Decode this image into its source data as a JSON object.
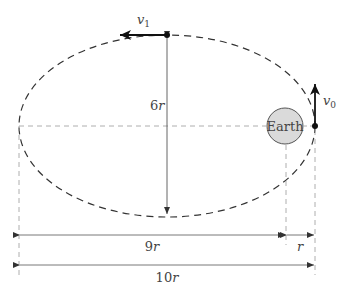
{
  "diagram": {
    "type": "elliptical-orbit",
    "labels": {
      "v1": "v",
      "v1_sub": "1",
      "v0": "v",
      "v0_sub": "0",
      "earth": "Earth",
      "semi_minor_num": "6",
      "semi_minor_var": "r",
      "dist_9_num": "9",
      "dist_9_var": "r",
      "dist_r": "r",
      "dist_10_num": "10",
      "dist_10_var": "r"
    },
    "colors": {
      "line": "#1a1a1a",
      "guide": "#888888",
      "earth_fill": "#d9d9d9",
      "text": "#444444"
    }
  }
}
